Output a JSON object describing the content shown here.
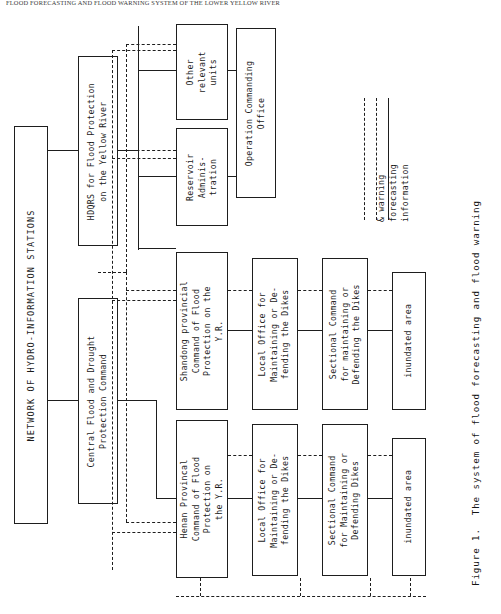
{
  "running_head": "FLOOD FORECASTING AND FLOOD WARNING SYSTEM OF THE LOWER YELLOW RIVER",
  "figure": {
    "caption": "Figure 1.  The system of flood forecasting and flood warning"
  },
  "boxes": {
    "network": "NETWORK OF HYDRO-INFORMATION STATIONS",
    "hdqrs_yellow_river": "HDQRS for Flood Protection\non the Yellow River",
    "central_command": "Central Flood and Drought\nProtection Command",
    "other_units": "Other\nrelevant\nunits",
    "reservoir_admin": "Reservoir\nAdminis-\ntration",
    "operation_office": "Operation Commanding\nOffice",
    "shandong_command": "Shandong provincial\nCommand of Flood\nProtection on the\nY.R.",
    "henan_command": "Henan Provincal\nCommand of Flood\nProtection on\nthe Y.R.",
    "local_office_shandong": "Local Office for\nMaintaining or De-\nfending the Dikes",
    "local_office_henan": "Local Office for\nMaintaining or De-\nfending the Dikes",
    "sectional_shandong": "Sectional Command\nfor maintaining or\nDefending the Dikes",
    "sectional_henan": "Sectional Command\nfor Maintaining or\nDefending Dikes",
    "inundated_shandong": "inundated area",
    "inundated_henan": "inundated area"
  },
  "legend": {
    "items": [
      {
        "label": "information",
        "style": "solid"
      },
      {
        "label": "forecasting",
        "style": "dashed"
      },
      {
        "label": "& warning",
        "style": "dash-dot"
      }
    ]
  },
  "colors": {
    "ink": "#1e1e1e",
    "paper": "#ffffff"
  }
}
